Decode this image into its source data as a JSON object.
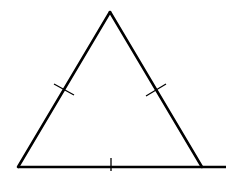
{
  "diagram": {
    "stroke_color": "#000000",
    "background": "#ffffff",
    "stroke_width": 2.6,
    "tick_stroke_width": 1.3,
    "vertices": {
      "apex": [
        110,
        12
      ],
      "bottom_left": [
        18,
        167
      ],
      "bottom_right": [
        202,
        167
      ]
    },
    "base_extension_end": [
      226,
      167
    ],
    "ticks": [
      {
        "side": "left",
        "from": [
          54,
          84
        ],
        "to": [
          74,
          95
        ]
      },
      {
        "side": "right",
        "from": [
          146,
          96
        ],
        "to": [
          166,
          84
        ]
      },
      {
        "side": "bottom",
        "from": [
          111,
          158
        ],
        "to": [
          111,
          171
        ]
      }
    ]
  }
}
